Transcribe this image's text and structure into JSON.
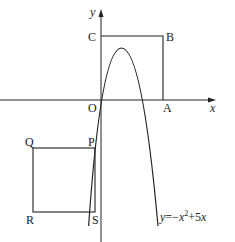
{
  "top_fragment": "",
  "diagram": {
    "axes": {
      "x_label": "x",
      "y_label": "y",
      "origin_label": "O"
    },
    "square_OABC": {
      "labels": {
        "O": "O",
        "A": "A",
        "B": "B",
        "C": "C"
      }
    },
    "square_PQRS": {
      "labels": {
        "P": "P",
        "Q": "Q",
        "R": "R",
        "S": "S"
      }
    },
    "curve": {
      "equation_label": "y=−x²+5x",
      "eq_y": "y",
      "eq_eq": "=−",
      "eq_x": "x",
      "eq_sup": "2",
      "eq_rest": "+5",
      "eq_x2": "x"
    },
    "colors": {
      "stroke": "#222222",
      "background": "#ffffff"
    }
  }
}
